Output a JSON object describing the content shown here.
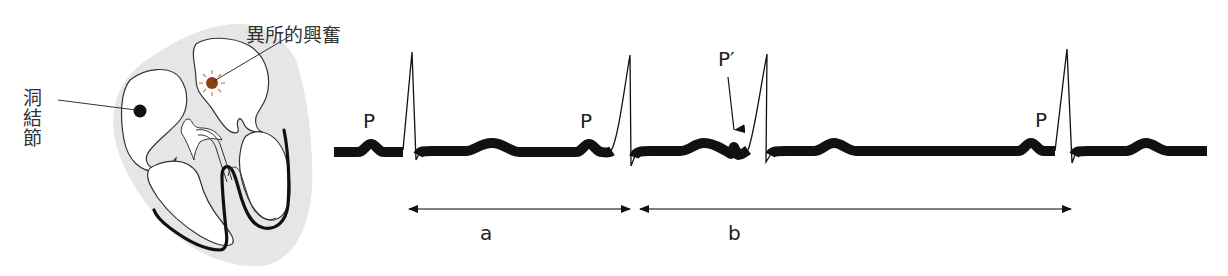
{
  "diagram": {
    "heart": {
      "sa_node_label": "洞結節",
      "ectopic_label": "異所的興奮",
      "colors": {
        "tissue": "#e6e6e6",
        "outline": "#333333",
        "conduction": "#111111",
        "sa_node": "#111111",
        "ectopic_focus": "#8b3f14",
        "ectopic_rays": "#c98a5a"
      }
    },
    "ecg": {
      "wave_labels": [
        "P",
        "P",
        "P′",
        "P"
      ],
      "interval_labels": {
        "a": "a",
        "b": "b"
      },
      "description": "Premature atrial contraction: P′ arrives early, interval b is longer than a"
    }
  }
}
